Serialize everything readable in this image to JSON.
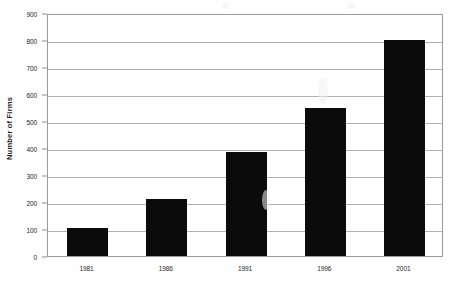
{
  "chart_data": {
    "type": "bar",
    "title": "",
    "subtitle": "",
    "xlabel": "",
    "ylabel": "Number of Firms",
    "categories": [
      "1981",
      "1986",
      "1991",
      "1996",
      "2001"
    ],
    "values": [
      105,
      210,
      385,
      548,
      800
    ],
    "series": [
      {
        "name": "Number of Firms",
        "values": [
          105,
          210,
          385,
          548,
          800
        ]
      }
    ],
    "ylim": [
      0,
      900
    ],
    "y_ticks": [
      0,
      100,
      200,
      300,
      400,
      500,
      600,
      700,
      800,
      900
    ],
    "y_tick_labels": [
      "0",
      "100",
      "200",
      "300",
      "400",
      "500",
      "600",
      "700",
      "800",
      "900"
    ],
    "grid": true,
    "legend": false,
    "legend_position": "none",
    "bar_color": "#0b0b0b",
    "gridline_color": "#b0b0b0",
    "axis_color": "#9a9a9a",
    "annotations": []
  }
}
